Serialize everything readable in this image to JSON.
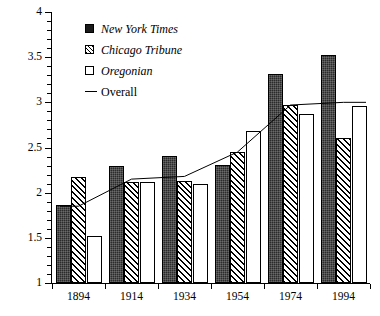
{
  "chart_data": {
    "type": "bar",
    "title": "",
    "subtitle": "",
    "xlabel": "",
    "ylabel": "",
    "categories": [
      "1894",
      "1914",
      "1934",
      "1954",
      "1974",
      "1994"
    ],
    "ylim": [
      1,
      4
    ],
    "y_ticks_major": [
      "1",
      "1.5",
      "2",
      "2.5",
      "3",
      "3.5",
      "4"
    ],
    "y_tick_step_minor": 0.1,
    "grid": false,
    "legend_position": "upper-left-inside",
    "series": [
      {
        "name": "New York Times",
        "style": "bar",
        "fill": "solid-black",
        "values": [
          1.86,
          2.3,
          2.41,
          2.31,
          3.31,
          3.52
        ]
      },
      {
        "name": "Chicago Tribune",
        "style": "bar",
        "fill": "diagonal-hatch",
        "values": [
          2.17,
          2.12,
          2.13,
          2.45,
          2.97,
          2.61
        ]
      },
      {
        "name": "Oregonian",
        "style": "bar",
        "fill": "white",
        "values": [
          1.52,
          2.12,
          2.1,
          2.68,
          2.87,
          2.96
        ]
      },
      {
        "name": "Overall",
        "style": "line",
        "fill": "none",
        "values": [
          1.85,
          2.15,
          2.18,
          2.45,
          2.97,
          3.0
        ]
      }
    ]
  },
  "legend": {
    "items": [
      {
        "label": "New York Times",
        "marker": "filled-square-swatch",
        "italic": true
      },
      {
        "label": "Chicago Tribune",
        "marker": "hatched-square-swatch",
        "italic": true
      },
      {
        "label": "Oregonian",
        "marker": "empty-square-swatch",
        "italic": true
      },
      {
        "label": "Overall",
        "marker": "line-swatch",
        "italic": false
      }
    ]
  },
  "colors": {
    "axis": "#000000",
    "nyt": "#1a1a1a",
    "tribune": "#000000",
    "oregonian": "#ffffff",
    "overall_line": "#000000",
    "background": "#ffffff"
  }
}
